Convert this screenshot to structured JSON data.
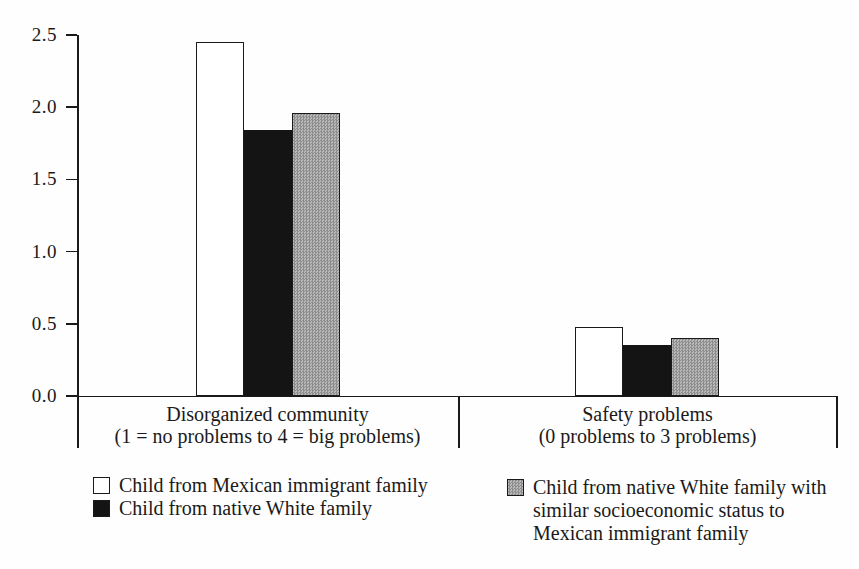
{
  "chart_data": {
    "type": "bar",
    "title": "",
    "xlabel": "",
    "ylabel": "",
    "ylim": [
      0,
      2.5
    ],
    "y_ticks": [
      "2.5",
      "2.0",
      "1.5",
      "1.0",
      "0.5",
      "0.0"
    ],
    "grid": false,
    "legend_position": "bottom",
    "categories": [
      {
        "label": "Disorganized community\n(1 = no problems to 4 = big problems)"
      },
      {
        "label": "Safety problems\n(0 problems to 3 problems)"
      }
    ],
    "series": [
      {
        "name": "Child from Mexican immigrant family",
        "fill": "white",
        "values": [
          2.45,
          0.48
        ]
      },
      {
        "name": "Child from native White family",
        "fill": "black",
        "values": [
          1.84,
          0.35
        ]
      },
      {
        "name": "Child from native White family with similar socioeconomic status to Mexican immigrant family",
        "fill": "gray",
        "values": [
          1.96,
          0.4
        ]
      }
    ]
  },
  "legend": {
    "items": [
      {
        "swatch": "white",
        "label": "Child from Mexican immigrant family"
      },
      {
        "swatch": "black",
        "label": "Child from native White family"
      },
      {
        "swatch": "gray",
        "label": "Child from native White family with\nsimilar socioeconomic status to\nMexican immigrant family"
      }
    ]
  },
  "colors": {
    "bar_white": "#ffffff",
    "bar_black": "#141414",
    "bar_gray_halftone": "#a3a3a3",
    "axis": "#1a1a1a",
    "text": "#1a1a1a",
    "background": "#ffffff"
  }
}
